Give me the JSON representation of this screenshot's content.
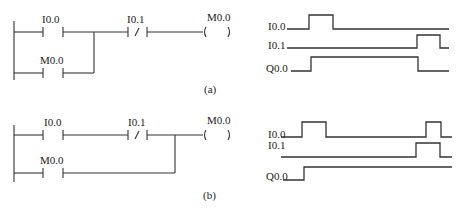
{
  "figures": [
    {
      "id": "a",
      "caption": "(a)",
      "ladder": {
        "contacts": [
          {
            "label": "I0.0",
            "type": "NO"
          },
          {
            "label": "M0.0",
            "type": "NO"
          },
          {
            "label": "I0.1",
            "type": "NC"
          }
        ],
        "coil": {
          "label": "M0.0"
        }
      },
      "timing": {
        "signals": [
          {
            "name": "I0.0"
          },
          {
            "name": "I0.1"
          },
          {
            "name": "Q0.0"
          }
        ]
      }
    },
    {
      "id": "b",
      "caption": "(b)",
      "ladder": {
        "contacts": [
          {
            "label": "I0.0",
            "type": "NO"
          },
          {
            "label": "I0.1",
            "type": "NC"
          },
          {
            "label": "M0.0",
            "type": "NO"
          }
        ],
        "coil": {
          "label": "M0.0"
        }
      },
      "timing": {
        "signals": [
          {
            "name": "I0.0"
          },
          {
            "name": "I0.1"
          },
          {
            "name": "Q0.0"
          }
        ]
      }
    }
  ]
}
